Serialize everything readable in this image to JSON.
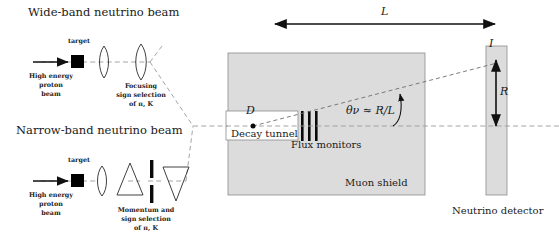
{
  "panels": {
    "wideband": {
      "heading": "Wide-band neutrino beam",
      "target_label": "target",
      "beam_label_line1": "High energy",
      "beam_label_line2": "proton",
      "beam_label_line3": "beam",
      "optics_caption_line1": "Focusing",
      "optics_caption_line2": "sign selection",
      "optics_caption_line3": "of π, K"
    },
    "narrowband": {
      "heading": "Narrow-band neutrino beam",
      "target_label": "target",
      "beam_label_line1": "High energy",
      "beam_label_line2": "proton",
      "beam_label_line3": "beam",
      "optics_caption_line1": "Momentum and",
      "optics_caption_line2": "sign selection",
      "optics_caption_line3": "of π, K"
    }
  },
  "main": {
    "baseline_label": "L",
    "decay_point_label": "D",
    "decay_tunnel_label": "Decay tunnel",
    "flux_monitors_label": "Flux monitors",
    "muon_shield_label": "Muon shield",
    "angle_formula": "θν ≈ R/L",
    "angle_symbol": "θ",
    "angle_subscript": "ν",
    "angle_relation": "≈ R/L",
    "detector_label": "Neutrino detector",
    "detector_radius_label": "R",
    "detector_current_label": "I"
  },
  "colors": {
    "shield_fill": "#dcdcdc",
    "shield_stroke": "#8c8c8c",
    "ink": "#1a1a1a",
    "dash": "#9a9a9a",
    "black": "#000000"
  }
}
